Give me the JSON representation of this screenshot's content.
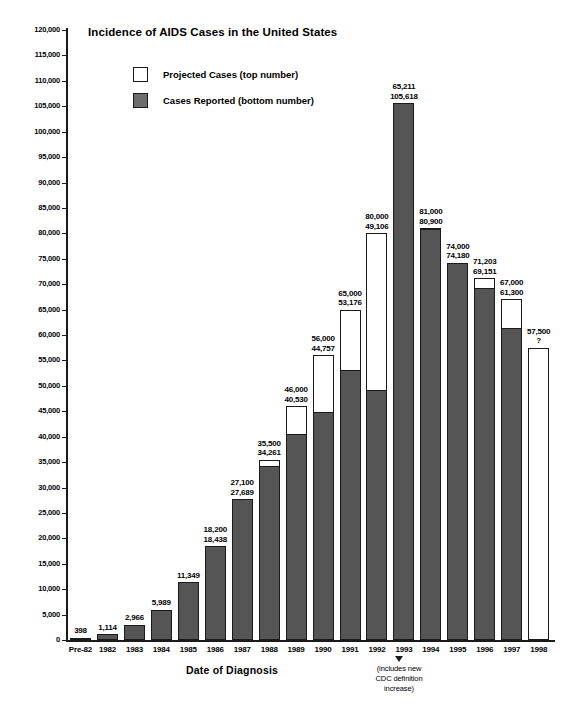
{
  "chart_data": {
    "type": "bar",
    "title": "Incidence of AIDS Cases in the United States",
    "xlabel": "Date of Diagnosis",
    "ylabel": "Cases",
    "ylim": [
      0,
      120000
    ],
    "ytick_step": 5000,
    "grid": false,
    "legend_position": "top-left-inside",
    "categories": [
      "Pre-82",
      "1982",
      "1983",
      "1984",
      "1985",
      "1986",
      "1987",
      "1988",
      "1989",
      "1990",
      "1991",
      "1992",
      "1993",
      "1994",
      "1995",
      "1996",
      "1997",
      "1998"
    ],
    "series": [
      {
        "name": "Projected Cases (top number)",
        "color": "#ffffff",
        "values": [
          null,
          null,
          null,
          null,
          null,
          null,
          null,
          35500,
          46000,
          56000,
          65000,
          80000,
          65211,
          81000,
          74000,
          71203,
          67000,
          57500
        ]
      },
      {
        "name": "Cases Reported (bottom number)",
        "color": "#555555",
        "values": [
          398,
          1114,
          2966,
          5989,
          11349,
          18438,
          27689,
          34261,
          40530,
          44757,
          53176,
          49106,
          105618,
          80900,
          74180,
          69151,
          61300,
          null
        ]
      }
    ],
    "bar_labels": [
      {
        "category": "Pre-82",
        "top": "",
        "bottom": "398"
      },
      {
        "category": "1982",
        "top": "",
        "bottom": "1,114"
      },
      {
        "category": "1983",
        "top": "",
        "bottom": "2,966"
      },
      {
        "category": "1984",
        "top": "",
        "bottom": "5,989"
      },
      {
        "category": "1985",
        "top": "",
        "bottom": "11,349"
      },
      {
        "category": "1986",
        "top": "18,200",
        "bottom": "18,438"
      },
      {
        "category": "1987",
        "top": "27,100",
        "bottom": "27,689"
      },
      {
        "category": "1988",
        "top": "35,500",
        "bottom": "34,261"
      },
      {
        "category": "1989",
        "top": "46,000",
        "bottom": "40,530"
      },
      {
        "category": "1990",
        "top": "56,000",
        "bottom": "44,757"
      },
      {
        "category": "1991",
        "top": "65,000",
        "bottom": "53,176"
      },
      {
        "category": "1992",
        "top": "80,000",
        "bottom": "49,106"
      },
      {
        "category": "1993",
        "top": "65,211",
        "bottom": "105,618"
      },
      {
        "category": "1994",
        "top": "81,000",
        "bottom": "80,900"
      },
      {
        "category": "1995",
        "top": "74,000",
        "bottom": "74,180"
      },
      {
        "category": "1996",
        "top": "71,203",
        "bottom": "69,151"
      },
      {
        "category": "1997",
        "top": "67,000",
        "bottom": "61,300"
      },
      {
        "category": "1998",
        "top": "57,500",
        "bottom": "?"
      }
    ],
    "ytick_labels": [
      "0",
      "5,000",
      "10,000",
      "15,000",
      "20,000",
      "25,000",
      "30,000",
      "35,000",
      "40,000",
      "45,000",
      "50,000",
      "55,000",
      "60,000",
      "65,000",
      "70,000",
      "75,000",
      "80,000",
      "85,000",
      "90,000",
      "95,000",
      "100,000",
      "105,000",
      "110,000",
      "115,000",
      "120,000"
    ],
    "annotations": [
      {
        "name": "cdc-definition-note",
        "text": "(includes new\nCDC definition\nincrease)",
        "line1": "(includes new",
        "line2": "CDC definition",
        "line3": "increase)",
        "anchor_category": "1993"
      }
    ]
  },
  "legend": {
    "items": [
      {
        "label": "Projected Cases (top number)",
        "swatch": "projected"
      },
      {
        "label": "Cases Reported (bottom number)",
        "swatch": "reported"
      }
    ]
  },
  "colors": {
    "bar_reported": "#555555",
    "bar_projected": "#ffffff",
    "axis": "#1a1a1a",
    "text": "#000000"
  }
}
